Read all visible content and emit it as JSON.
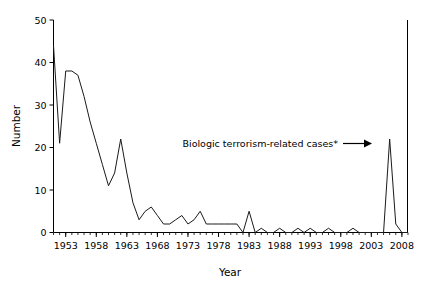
{
  "chart_data": {
    "type": "line",
    "title": "",
    "xlabel": "Year",
    "ylabel": "Number",
    "xlim": [
      1951,
      2009
    ],
    "ylim": [
      0,
      50
    ],
    "grid": false,
    "legend": null,
    "xticks": [
      1953,
      1958,
      1963,
      1968,
      1973,
      1978,
      1983,
      1988,
      1993,
      1998,
      2003,
      2008
    ],
    "xtick_labels": [
      "1953",
      "1958",
      "1963",
      "1968",
      "1973",
      "1978",
      "1983",
      "1988",
      "1993",
      "1998",
      "2003",
      "2008"
    ],
    "yticks": [
      0,
      10,
      20,
      30,
      40,
      50
    ],
    "ytick_labels": [
      "0",
      "10",
      "20",
      "30",
      "40",
      "50"
    ],
    "x": [
      1951,
      1952,
      1953,
      1954,
      1955,
      1956,
      1957,
      1958,
      1959,
      1960,
      1961,
      1962,
      1963,
      1964,
      1965,
      1966,
      1967,
      1968,
      1969,
      1970,
      1971,
      1972,
      1973,
      1974,
      1975,
      1976,
      1977,
      1978,
      1979,
      1980,
      1981,
      1982,
      1983,
      1984,
      1985,
      1986,
      1987,
      1988,
      1989,
      1990,
      1991,
      1992,
      1993,
      1994,
      1995,
      1996,
      1997,
      1998,
      1999,
      2000,
      2001,
      2002,
      2003,
      2004,
      2005,
      2006,
      2007,
      2008,
      2009
    ],
    "values": [
      44,
      21,
      38,
      38,
      37,
      32,
      26,
      21,
      16,
      11,
      14,
      22,
      14,
      7,
      3,
      5,
      6,
      4,
      2,
      2,
      3,
      4,
      2,
      3,
      5,
      2,
      2,
      2,
      2,
      2,
      2,
      0,
      5,
      0,
      1,
      0,
      0,
      1,
      0,
      0,
      1,
      0,
      1,
      0,
      0,
      1,
      0,
      0,
      0,
      1,
      0,
      0,
      0,
      0,
      0,
      22,
      2,
      0,
      0
    ],
    "series": [
      {
        "name": "Cases",
        "values": [
          44,
          21,
          38,
          38,
          37,
          32,
          26,
          21,
          16,
          11,
          14,
          22,
          14,
          7,
          3,
          5,
          6,
          4,
          2,
          2,
          3,
          4,
          2,
          3,
          5,
          2,
          2,
          2,
          2,
          2,
          2,
          0,
          5,
          0,
          1,
          0,
          0,
          1,
          0,
          0,
          1,
          0,
          1,
          0,
          0,
          1,
          0,
          0,
          0,
          1,
          0,
          0,
          0,
          0,
          0,
          22,
          2,
          0,
          0
        ],
        "color": "#1a1a1a"
      }
    ],
    "annotations": [
      {
        "text": "Biologic terrorism-related cases*",
        "target_x": 2001,
        "target_y": 22,
        "arrow": "right"
      }
    ]
  },
  "axes": {
    "y_title": "Number",
    "x_title": "Year"
  },
  "annotation": {
    "label": "Biologic terrorism-related cases*"
  }
}
